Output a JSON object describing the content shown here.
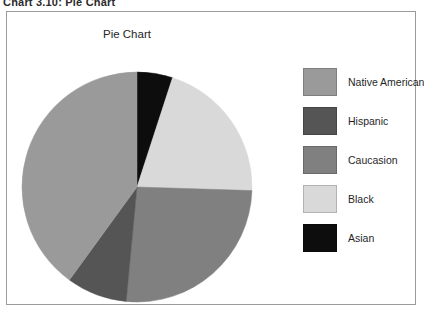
{
  "caption": "Chart 3.10: Pie Chart",
  "chart_title": "Pie Chart",
  "legend": {
    "items": [
      {
        "label": "Native American",
        "color": "#9a9a9a"
      },
      {
        "label": "Hispanic",
        "color": "#555555"
      },
      {
        "label": "Caucasion",
        "color": "#808080"
      },
      {
        "label": "Black",
        "color": "#d9d9d9"
      },
      {
        "label": "Asian",
        "color": "#0d0d0d"
      }
    ]
  },
  "chart_data": {
    "type": "pie",
    "title": "Pie Chart",
    "labels": [
      "Asian",
      "Black",
      "Caucasion",
      "Hispanic",
      "Native American"
    ],
    "values": [
      5,
      20.5,
      26,
      8.5,
      40
    ],
    "unit": "percent",
    "colors": [
      "#0d0d0d",
      "#d9d9d9",
      "#808080",
      "#555555",
      "#9a9a9a"
    ],
    "start_angle_deg": 0,
    "direction": "clockwise",
    "legend_position": "right",
    "grid": false,
    "xlabel": "",
    "ylabel": ""
  }
}
